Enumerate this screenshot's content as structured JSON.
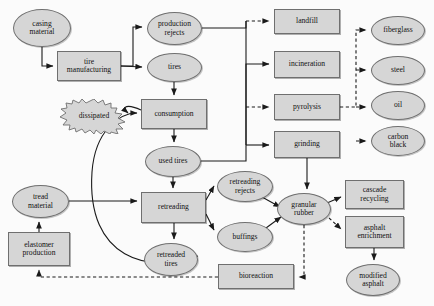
{
  "diagram": {
    "style": {
      "node_fill": "#d6d6d6",
      "node_stroke": "#6f6f6f",
      "edge_color": "#1a1a1a",
      "background": "#fbfbfb"
    },
    "nodes": [
      {
        "id": "casing_material",
        "label": "casing\nmaterial",
        "shape": "ellipse",
        "x": 13,
        "y": 9,
        "w": 58,
        "h": 38
      },
      {
        "id": "tire_manufacturing",
        "label": "tire\nmanufacturing",
        "shape": "box",
        "x": 57,
        "y": 51,
        "w": 64,
        "h": 30
      },
      {
        "id": "production_rejects",
        "label": "production\nrejects",
        "shape": "ellipse",
        "x": 147,
        "y": 12,
        "w": 55,
        "h": 33
      },
      {
        "id": "tires",
        "label": "tires",
        "shape": "ellipse",
        "x": 147,
        "y": 53,
        "w": 55,
        "h": 29
      },
      {
        "id": "consumption",
        "label": "consumption",
        "shape": "box",
        "x": 141,
        "y": 99,
        "w": 66,
        "h": 30
      },
      {
        "id": "dissipated",
        "label": "dissipated",
        "shape": "burst",
        "x": 58,
        "y": 99,
        "w": 72,
        "h": 35
      },
      {
        "id": "used_tires",
        "label": "used tires",
        "shape": "ellipse",
        "x": 145,
        "y": 146,
        "w": 56,
        "h": 31
      },
      {
        "id": "tread_material",
        "label": "tread\nmaterial",
        "shape": "ellipse",
        "x": 12,
        "y": 185,
        "w": 57,
        "h": 33
      },
      {
        "id": "elastomer_production",
        "label": "elastomer\nproduction",
        "shape": "box",
        "x": 8,
        "y": 232,
        "w": 62,
        "h": 34
      },
      {
        "id": "retreading",
        "label": "retreading",
        "shape": "box",
        "x": 141,
        "y": 192,
        "w": 65,
        "h": 31
      },
      {
        "id": "retreaded_tires",
        "label": "retreaded\ntires",
        "shape": "ellipse",
        "x": 144,
        "y": 243,
        "w": 54,
        "h": 33
      },
      {
        "id": "retreading_rejects",
        "label": "retreading\nrejects",
        "shape": "ellipse",
        "x": 217,
        "y": 171,
        "w": 56,
        "h": 31
      },
      {
        "id": "buffings",
        "label": "buffings",
        "shape": "ellipse",
        "x": 217,
        "y": 222,
        "w": 56,
        "h": 30
      },
      {
        "id": "granular_rubber",
        "label": "granular\nrubber",
        "shape": "ellipse",
        "x": 277,
        "y": 193,
        "w": 54,
        "h": 32
      },
      {
        "id": "landfill",
        "label": "landfill",
        "shape": "box",
        "x": 274,
        "y": 9,
        "w": 66,
        "h": 25
      },
      {
        "id": "incineration",
        "label": "incineration",
        "shape": "box",
        "x": 274,
        "y": 51,
        "w": 66,
        "h": 27
      },
      {
        "id": "pyrolysis",
        "label": "pyrolysis",
        "shape": "box",
        "x": 274,
        "y": 94,
        "w": 66,
        "h": 26
      },
      {
        "id": "grinding",
        "label": "grinding",
        "shape": "box",
        "x": 274,
        "y": 131,
        "w": 66,
        "h": 27
      },
      {
        "id": "fiberglass",
        "label": "fiberglass",
        "shape": "ellipse",
        "x": 371,
        "y": 16,
        "w": 54,
        "h": 29
      },
      {
        "id": "steel",
        "label": "steel",
        "shape": "ellipse",
        "x": 371,
        "y": 56,
        "w": 54,
        "h": 29
      },
      {
        "id": "oil",
        "label": "oil",
        "shape": "ellipse",
        "x": 371,
        "y": 91,
        "w": 54,
        "h": 29
      },
      {
        "id": "carbon_black",
        "label": "carbon\nblack",
        "shape": "ellipse",
        "x": 371,
        "y": 126,
        "w": 54,
        "h": 30
      },
      {
        "id": "cascade_recycling",
        "label": "cascade\nrecycling",
        "shape": "box",
        "x": 345,
        "y": 180,
        "w": 59,
        "h": 29
      },
      {
        "id": "asphalt_enrichment",
        "label": "asphalt\nenrichment",
        "shape": "box",
        "x": 345,
        "y": 216,
        "w": 59,
        "h": 32
      },
      {
        "id": "modified_asphalt",
        "label": "modified\nasphalt",
        "shape": "ellipse",
        "x": 346,
        "y": 264,
        "w": 54,
        "h": 32
      },
      {
        "id": "bioreaction",
        "label": "bioreaction",
        "shape": "box",
        "x": 218,
        "y": 264,
        "w": 76,
        "h": 25
      }
    ],
    "edges": [
      {
        "from": "casing_material",
        "to": "tire_manufacturing",
        "style": "solid"
      },
      {
        "from": "tire_manufacturing",
        "to": "production_rejects",
        "style": "solid"
      },
      {
        "from": "tire_manufacturing",
        "to": "tires",
        "style": "solid"
      },
      {
        "from": "tires",
        "to": "consumption",
        "style": "solid"
      },
      {
        "from": "consumption",
        "to": "dissipated",
        "style": "solid"
      },
      {
        "from": "consumption",
        "to": "used_tires",
        "style": "solid"
      },
      {
        "from": "used_tires",
        "to": "retreading",
        "style": "solid"
      },
      {
        "from": "used_tires",
        "to": "trunk_right",
        "style": "solid"
      },
      {
        "from": "production_rejects",
        "to": "trunk_right",
        "style": "solid"
      },
      {
        "from": "trunk_right",
        "to": "landfill",
        "style": "dashed"
      },
      {
        "from": "trunk_right",
        "to": "incineration",
        "style": "solid"
      },
      {
        "from": "trunk_right",
        "to": "pyrolysis",
        "style": "dashed"
      },
      {
        "from": "trunk_right",
        "to": "grinding",
        "style": "solid"
      },
      {
        "from": "pyrolysis",
        "to": "fiberglass",
        "style": "dashed"
      },
      {
        "from": "pyrolysis",
        "to": "steel",
        "style": "dashed"
      },
      {
        "from": "pyrolysis",
        "to": "oil",
        "style": "dashed"
      },
      {
        "from": "pyrolysis",
        "to": "carbon_black",
        "style": "dashed"
      },
      {
        "from": "grinding",
        "to": "granular_rubber",
        "style": "solid"
      },
      {
        "from": "tread_material",
        "to": "retreading",
        "style": "solid"
      },
      {
        "from": "elastomer_production",
        "to": "tread_material",
        "style": "solid"
      },
      {
        "from": "bioreaction",
        "to": "elastomer_production",
        "style": "dashed"
      },
      {
        "from": "retreading",
        "to": "retreading_rejects",
        "style": "solid"
      },
      {
        "from": "retreading",
        "to": "buffings",
        "style": "solid"
      },
      {
        "from": "retreading",
        "to": "retreaded_tires",
        "style": "solid"
      },
      {
        "from": "retreaded_tires",
        "to": "consumption",
        "style": "solid"
      },
      {
        "from": "retreading_rejects",
        "to": "granular_rubber",
        "style": "solid"
      },
      {
        "from": "buffings",
        "to": "granular_rubber",
        "style": "solid"
      },
      {
        "from": "granular_rubber",
        "to": "cascade_recycling",
        "style": "solid"
      },
      {
        "from": "granular_rubber",
        "to": "asphalt_enrichment",
        "style": "dashed"
      },
      {
        "from": "granular_rubber",
        "to": "bioreaction",
        "style": "dashed"
      },
      {
        "from": "asphalt_enrichment",
        "to": "modified_asphalt",
        "style": "solid"
      }
    ]
  }
}
